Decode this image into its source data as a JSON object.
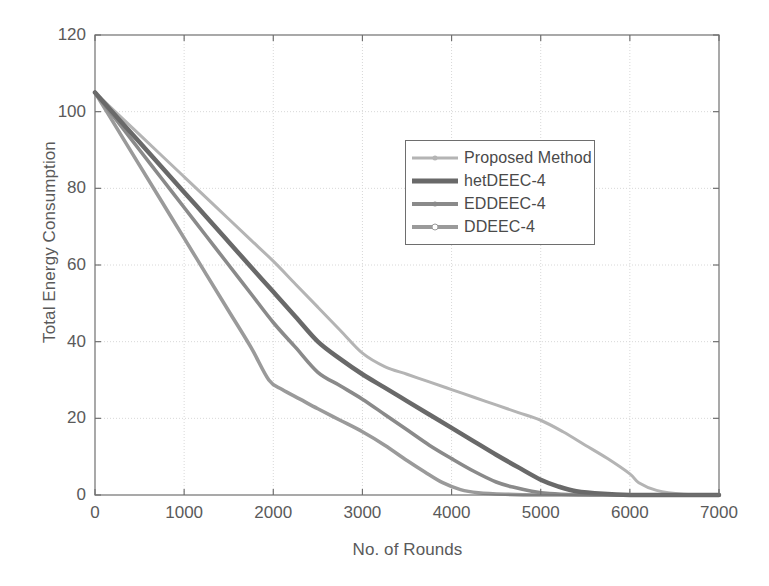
{
  "chart_data": {
    "type": "line",
    "title": "",
    "xlabel": "No. of Rounds",
    "ylabel": "Total Energy Consumption",
    "xlim": [
      0,
      7000
    ],
    "ylim": [
      0,
      120
    ],
    "xticks": [
      "0",
      "1000",
      "2000",
      "3000",
      "4000",
      "5000",
      "6000",
      "7000"
    ],
    "yticks": [
      "0",
      "20",
      "40",
      "60",
      "80",
      "100",
      "120"
    ],
    "xtick_values": [
      0,
      1000,
      2000,
      3000,
      4000,
      5000,
      6000,
      7000
    ],
    "ytick_values": [
      0,
      20,
      40,
      60,
      80,
      100,
      120
    ],
    "grid": true,
    "legend_position": "upper-center-right",
    "series": [
      {
        "name": "Proposed Method",
        "color": "#b4b4b4",
        "width": 3.0,
        "marker": "dot",
        "x": [
          0,
          250,
          500,
          750,
          1000,
          1250,
          1500,
          1750,
          2000,
          2250,
          2500,
          2750,
          3000,
          3250,
          3500,
          3750,
          4000,
          4250,
          4500,
          4750,
          5000,
          5250,
          5500,
          5750,
          6000,
          6100,
          6300,
          6600,
          7000
        ],
        "y": [
          105,
          99.5,
          94,
          88.5,
          83,
          77.5,
          72,
          66.5,
          61,
          55,
          49,
          43,
          37,
          33.5,
          31.5,
          29.5,
          27.5,
          25.5,
          23.5,
          21.5,
          19.5,
          16.5,
          13,
          9.5,
          5.5,
          3.2,
          1.2,
          0.2,
          0
        ]
      },
      {
        "name": "hetDEEC-4",
        "color": "#696969",
        "width": 4.5,
        "marker": "none",
        "x": [
          0,
          250,
          500,
          750,
          1000,
          1250,
          1500,
          1750,
          2000,
          2250,
          2500,
          2750,
          3000,
          3250,
          3500,
          3750,
          4000,
          4250,
          4500,
          4750,
          5000,
          5200,
          5400,
          5700,
          6000,
          6500,
          7000
        ],
        "y": [
          105,
          98.5,
          92,
          85.5,
          79,
          72.5,
          66,
          59.5,
          53,
          46.5,
          40,
          35.5,
          31.5,
          28,
          24.5,
          21,
          17.5,
          14,
          10.5,
          7.2,
          4.0,
          2.2,
          1.0,
          0.3,
          0,
          0,
          0
        ]
      },
      {
        "name": "EDDEEC-4",
        "color": "#8a8a8a",
        "width": 3.6,
        "marker": "dot",
        "x": [
          0,
          250,
          500,
          750,
          1000,
          1250,
          1500,
          1750,
          2000,
          2250,
          2500,
          2750,
          3000,
          3250,
          3500,
          3750,
          4000,
          4250,
          4500,
          4700,
          4900,
          5100,
          5400,
          5800,
          6200,
          7000
        ],
        "y": [
          105,
          97.5,
          90,
          82.5,
          75,
          67.5,
          60,
          52.5,
          45,
          38.5,
          32,
          28.5,
          25,
          21,
          17,
          13,
          9.5,
          6.2,
          3.4,
          2.0,
          1.0,
          0.4,
          0.1,
          0,
          0,
          0
        ]
      },
      {
        "name": "DDEEC-4",
        "color": "#9a9a9a",
        "width": 3.6,
        "marker": "circle",
        "x": [
          0,
          250,
          500,
          750,
          1000,
          1250,
          1500,
          1750,
          1950,
          2100,
          2300,
          2500,
          2750,
          3000,
          3250,
          3500,
          3700,
          3900,
          4100,
          4300,
          4600,
          5000,
          5500,
          6000,
          7000
        ],
        "y": [
          105,
          95.5,
          86,
          76.5,
          67,
          57.5,
          48,
          38.5,
          30,
          27.5,
          25,
          22.5,
          19.5,
          16.5,
          13,
          9.0,
          6.0,
          3.2,
          1.4,
          0.6,
          0.2,
          0,
          0,
          0,
          0
        ]
      }
    ]
  },
  "axes": {
    "frame_color": "#707070",
    "grid_color": "#d8d8d8",
    "background": "#ffffff"
  },
  "legend": {
    "entries": [
      {
        "label": "Proposed Method"
      },
      {
        "label": "hetDEEC-4"
      },
      {
        "label": "EDDEEC-4"
      },
      {
        "label": "DDEEC-4"
      }
    ]
  }
}
